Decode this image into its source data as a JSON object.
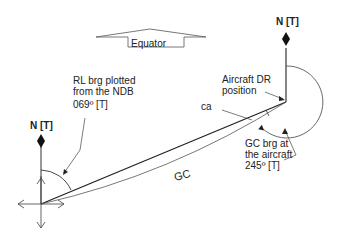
{
  "diagram": {
    "equator_label": "Equator",
    "north_label_ndb": "N [T]",
    "north_label_aircraft": "N [T]",
    "rl_brg_label": [
      "RL brg plotted",
      "from the NDB",
      "069º [T]"
    ],
    "aircraft_dr_label": [
      "Aircraft DR",
      "position"
    ],
    "ca_label": "ca",
    "gc_label": "GC",
    "gc_brg_label": [
      "GC brg at",
      "the aircraft",
      "245º [T]"
    ],
    "line_color": "#222222",
    "rl_bearing_deg": 69,
    "gc_bearing_deg": 245
  }
}
